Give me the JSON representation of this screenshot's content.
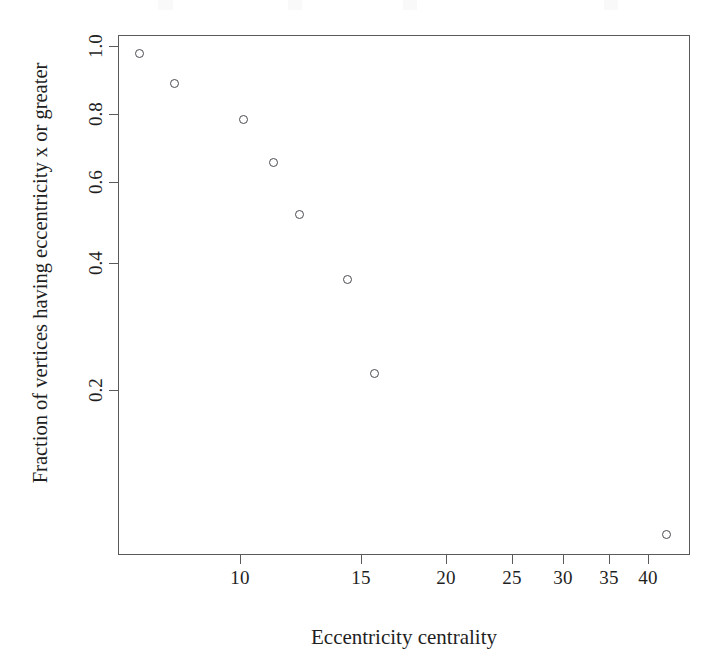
{
  "figure": {
    "background_color": "#ffffff",
    "axis_color": "#5a5a5a",
    "point_color": "#4a4a52"
  },
  "chart_data": {
    "type": "scatter",
    "title": "",
    "xlabel": "Eccentricity centrality",
    "ylabel": "Fraction of vertices having eccentricity x or greater",
    "xscale": "log",
    "yscale": "log",
    "xlim": [
      5.2,
      47.5
    ],
    "ylim": [
      0.042,
      1.06
    ],
    "grid": false,
    "legend": null,
    "marker": "open-circle",
    "x_tick_labels": [
      "10",
      "15",
      "20",
      "25",
      "30",
      "35",
      "40"
    ],
    "x_tick_values": [
      10,
      15,
      20,
      25,
      30,
      35,
      40
    ],
    "y_tick_labels": [
      "0.2",
      "0.4",
      "0.6",
      "0.8",
      "1.0"
    ],
    "y_tick_values": [
      0.2,
      0.4,
      0.6,
      0.8,
      1.0
    ],
    "x": [
      5.6,
      6.7,
      10.0,
      11.3,
      12.4,
      14.2,
      15.7,
      41.5
    ],
    "y": [
      0.99,
      0.87,
      0.75,
      0.62,
      0.5,
      0.38,
      0.26,
      0.055
    ],
    "points": [
      {
        "x": 5.6,
        "y": 0.99,
        "px": 138,
        "py": 52
      },
      {
        "x": 6.7,
        "y": 0.87,
        "px": 173,
        "py": 82
      },
      {
        "x": 10.0,
        "y": 0.75,
        "px": 242,
        "py": 118
      },
      {
        "x": 11.3,
        "y": 0.62,
        "px": 272,
        "py": 161
      },
      {
        "x": 12.4,
        "y": 0.5,
        "px": 298,
        "py": 213
      },
      {
        "x": 14.2,
        "y": 0.38,
        "px": 346,
        "py": 278
      },
      {
        "x": 15.7,
        "y": 0.26,
        "px": 373,
        "py": 372
      },
      {
        "x": 41.5,
        "y": 0.055,
        "px": 665,
        "py": 533
      }
    ],
    "x_tick_px": [
      240,
      361,
      446,
      512,
      563,
      609,
      648
    ],
    "y_tick_px": [
      390,
      263,
      182,
      114,
      46
    ]
  }
}
